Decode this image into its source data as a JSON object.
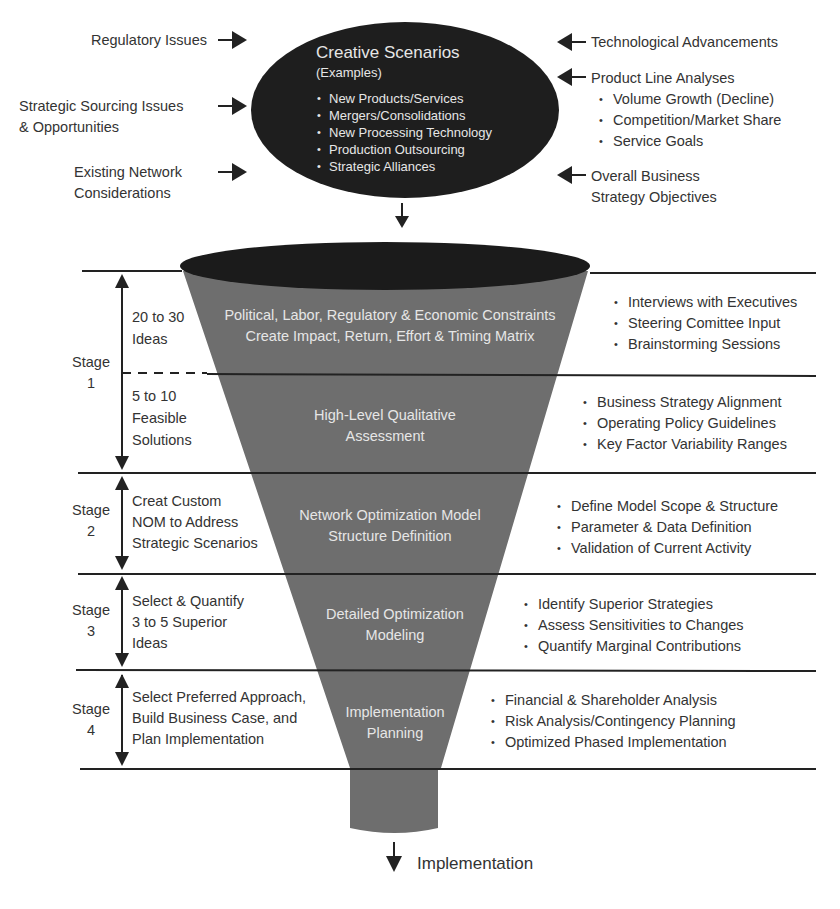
{
  "ellipse": {
    "title": "Creative Scenarios",
    "subtitle": "(Examples)",
    "items": [
      "New Products/Services",
      "Mergers/Consolidations",
      "New Processing Technology",
      "Production Outsourcing",
      "Strategic Alliances"
    ]
  },
  "left_inputs": [
    {
      "line1": "Regulatory Issues",
      "line2": ""
    },
    {
      "line1": "Strategic Sourcing Issues",
      "line2": "& Opportunities"
    },
    {
      "line1": "Existing Network",
      "line2": "Considerations"
    }
  ],
  "right_inputs": {
    "tech": "Technological Advancements",
    "product_line": {
      "title": "Product Line Analyses",
      "items": [
        "Volume Growth (Decline)",
        "Competition/Market Share",
        "Service Goals"
      ]
    },
    "business": {
      "line1": "Overall Business",
      "line2": "Strategy Objectives"
    }
  },
  "stages": [
    {
      "label": "Stage",
      "num": "1"
    },
    {
      "label": "Stage",
      "num": "2"
    },
    {
      "label": "Stage",
      "num": "3"
    },
    {
      "label": "Stage",
      "num": "4"
    }
  ],
  "steps": [
    {
      "desc": [
        "20 to 30",
        "Ideas"
      ],
      "funnel": [
        "Political, Labor, Regulatory & Economic Constraints",
        "Create Impact, Return, Effort & Timing Matrix"
      ],
      "bullets": [
        "Interviews with Executives",
        "Steering Comittee Input",
        "Brainstorming Sessions"
      ]
    },
    {
      "desc": [
        "5 to 10",
        "Feasible",
        "Solutions"
      ],
      "funnel": [
        "High-Level Qualitative",
        "Assessment"
      ],
      "bullets": [
        "Business Strategy Alignment",
        "Operating Policy Guidelines",
        "Key Factor Variability Ranges"
      ]
    },
    {
      "desc": [
        "Creat Custom",
        "NOM to Address",
        "Strategic Scenarios"
      ],
      "funnel": [
        "Network Optimization Model",
        "Structure Definition"
      ],
      "bullets": [
        "Define Model Scope & Structure",
        "Parameter & Data Definition",
        "Validation of Current Activity"
      ]
    },
    {
      "desc": [
        "Select & Quantify",
        "3 to 5 Superior",
        "Ideas"
      ],
      "funnel": [
        "Detailed Optimization",
        "Modeling"
      ],
      "bullets": [
        "Identify Superior Strategies",
        "Assess Sensitivities to Changes",
        "Quantify Marginal Contributions"
      ]
    },
    {
      "desc": [
        "Select Preferred Approach,",
        "Build Business Case, and",
        "Plan Implementation"
      ],
      "funnel": [
        "Implementation",
        "Planning"
      ],
      "bullets": [
        "Financial & Shareholder Analysis",
        "Risk Analysis/Contingency Planning",
        "Optimized Phased Implementation"
      ]
    }
  ],
  "output": "Implementation",
  "colors": {
    "ellipse": "#1e1e1e",
    "funnel": "#6e6e6e",
    "lines": "#222222",
    "text": "#333333"
  }
}
